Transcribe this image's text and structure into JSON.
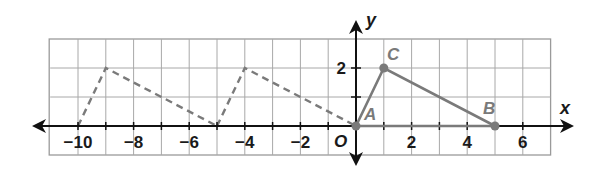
{
  "figure": {
    "axes": {
      "x_label": "x",
      "y_label": "y",
      "origin_label": "O",
      "x_ticks": [
        {
          "value": -10,
          "label": "−10"
        },
        {
          "value": -8,
          "label": "−8"
        },
        {
          "value": -6,
          "label": "−6"
        },
        {
          "value": -4,
          "label": "−4"
        },
        {
          "value": -2,
          "label": "−2"
        },
        {
          "value": 2,
          "label": "2"
        },
        {
          "value": 4,
          "label": "4"
        },
        {
          "value": 6,
          "label": "6"
        }
      ],
      "y_ticks": [
        {
          "value": 2,
          "label": "2"
        }
      ],
      "x_range": [
        -11,
        7
      ],
      "y_range": [
        -1,
        3
      ]
    },
    "grid": {
      "x_min": -11,
      "x_max": 7,
      "y_min": -1,
      "y_max": 3
    },
    "solid_triangle": {
      "color": "#7a7a7a",
      "vertices": [
        {
          "name": "A",
          "label": "A",
          "x": 0,
          "y": 0
        },
        {
          "name": "C",
          "label": "C",
          "x": 1,
          "y": 2
        },
        {
          "name": "B",
          "label": "B",
          "x": 5,
          "y": 0
        }
      ]
    },
    "dashed_triangles": [
      {
        "color": "#7a7a7a",
        "vertices": [
          {
            "x": -10,
            "y": 0
          },
          {
            "x": -9,
            "y": 2
          },
          {
            "x": -5,
            "y": 0
          }
        ]
      },
      {
        "color": "#7a7a7a",
        "vertices": [
          {
            "x": -5,
            "y": 0
          },
          {
            "x": -4,
            "y": 2
          },
          {
            "x": 0,
            "y": 0
          }
        ]
      }
    ]
  }
}
